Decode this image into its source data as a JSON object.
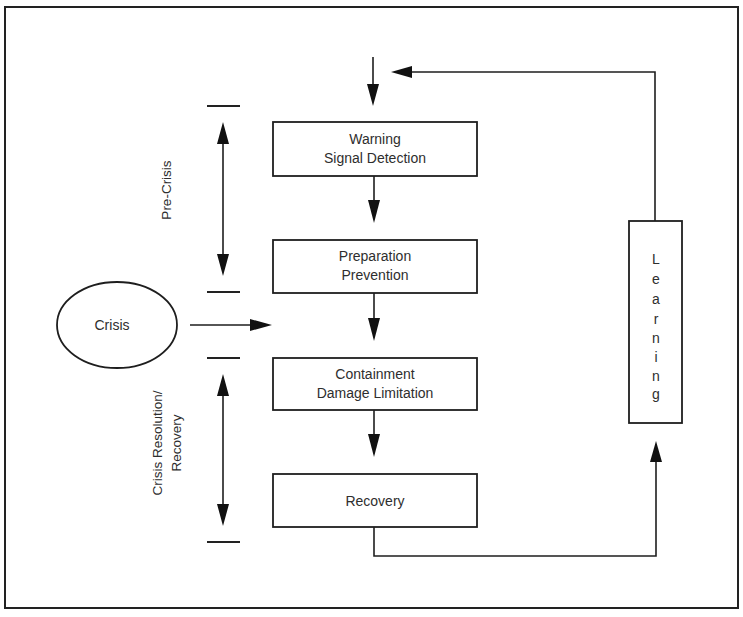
{
  "diagram": {
    "type": "crisis-management-process-flow",
    "stages": [
      {
        "id": "warning",
        "lines": [
          "Warning",
          "Signal Detection"
        ]
      },
      {
        "id": "preparation",
        "lines": [
          "Preparation",
          "Prevention"
        ]
      },
      {
        "id": "containment",
        "lines": [
          "Containment",
          "Damage Limitation"
        ]
      },
      {
        "id": "recovery",
        "lines": [
          "Recovery"
        ]
      }
    ],
    "trigger": {
      "label": "Crisis"
    },
    "feedback": {
      "label": "Learning",
      "letters": [
        "L",
        "e",
        "a",
        "r",
        "n",
        "i",
        "n",
        "g"
      ]
    },
    "phases": [
      {
        "id": "pre-crisis",
        "lines": [
          "Pre-Crisis"
        ]
      },
      {
        "id": "resolution",
        "lines": [
          "Crisis Resolution/",
          "Recovery"
        ]
      }
    ],
    "edges": [
      {
        "from": "start",
        "to": "warning"
      },
      {
        "from": "warning",
        "to": "preparation"
      },
      {
        "from": "crisis",
        "to": "between-preparation-containment"
      },
      {
        "from": "preparation",
        "to": "containment"
      },
      {
        "from": "containment",
        "to": "recovery"
      },
      {
        "from": "recovery",
        "to": "learning"
      },
      {
        "from": "learning",
        "to": "warning"
      }
    ],
    "colors": {
      "line": "#1e1e1e",
      "text": "#2e2e2e",
      "background": "#ffffff"
    }
  }
}
